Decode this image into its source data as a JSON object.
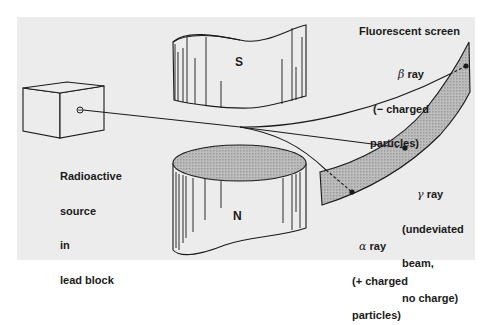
{
  "diagram": {
    "type": "physics-illustration",
    "colors": {
      "background": "#ffffff",
      "panel": "#ececec",
      "line": "#1a1a1a",
      "screen_fill": "#a9a9a9",
      "magnet_top_fill": "#b4b4b4"
    }
  },
  "labels": {
    "source": [
      "Radioactive",
      "source",
      "in",
      "lead block"
    ],
    "screen_title": "Fluorescent screen",
    "magnet_south": "S",
    "magnet_north": "N",
    "beta": {
      "symbol": "β",
      "name": "ray",
      "desc": [
        "(− charged",
        "particles)"
      ]
    },
    "gamma": {
      "symbol": "γ",
      "name": "ray",
      "desc": [
        "(undeviated",
        "beam,",
        "no charge)"
      ]
    },
    "alpha": {
      "symbol": "α",
      "name": "ray",
      "desc": [
        "(+ charged",
        "particles)"
      ]
    }
  }
}
